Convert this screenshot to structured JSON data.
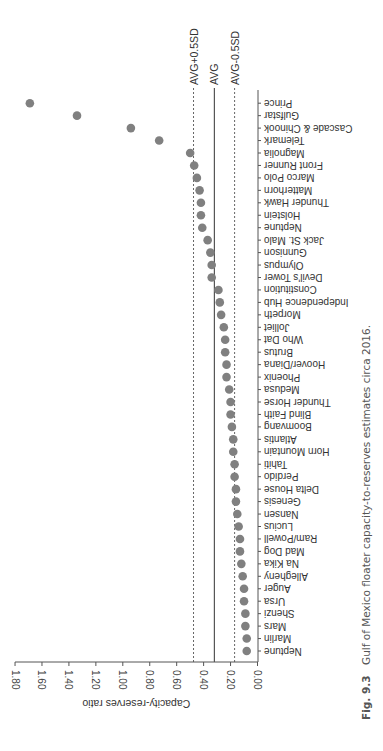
{
  "caption": {
    "label": "Fig. 9.3",
    "text": "Gulf of Mexico floater capacity-to-reserves estimates circa 2016."
  },
  "chart_data": {
    "type": "scatter",
    "orientation": "rotated-90",
    "title": "",
    "xlabel": "",
    "ylabel": "Capacity-reserves ratio",
    "ylim": [
      0,
      1.8
    ],
    "yticks": [
      "0.00",
      "0.20",
      "0.40",
      "0.60",
      "0.80",
      "1.00",
      "1.20",
      "1.40",
      "1.60",
      "1.80"
    ],
    "grid": false,
    "legend": null,
    "marker_color": "#808080",
    "categories": [
      "Neptune",
      "Marlin",
      "Mars",
      "Shenzi",
      "Ursa",
      "Auger",
      "Allegheny",
      "Na Kika",
      "Mad Dog",
      "Ram/Powell",
      "Lucius",
      "Nansen",
      "Genesis",
      "Delta House",
      "Perdido",
      "Tahiti",
      "Horn Mountain",
      "Atlantis",
      "Boomvang",
      "Blind Faith",
      "Thunder Horse",
      "Medusa",
      "Phoenix",
      "Hoover/Diana",
      "Brutus",
      "Who Dat",
      "Jolliet",
      "Morpeth",
      "Independence Hub",
      "Constitution",
      "Devil's Tower",
      "Olympus",
      "Gunnison",
      "Jack St. Malo",
      "Neptune",
      "Holstein",
      "Thunder Hawk",
      "Matterhorn",
      "Marco Polo",
      "Front Runner",
      "Magnolia",
      "Telemark",
      "Cascade & Chinook",
      "Gulfstar",
      "Prince"
    ],
    "values": [
      0.08,
      0.08,
      0.09,
      0.09,
      0.1,
      0.1,
      0.11,
      0.12,
      0.13,
      0.13,
      0.14,
      0.15,
      0.16,
      0.16,
      0.17,
      0.17,
      0.18,
      0.18,
      0.19,
      0.2,
      0.2,
      0.21,
      0.23,
      0.23,
      0.24,
      0.24,
      0.25,
      0.27,
      0.28,
      0.29,
      0.34,
      0.34,
      0.35,
      0.37,
      0.41,
      0.42,
      0.42,
      0.43,
      0.45,
      0.47,
      0.5,
      0.73,
      0.94,
      1.34,
      1.69
    ],
    "reference_lines": [
      {
        "label": "AVG+0.5SD",
        "value": 0.475,
        "style": "dashed"
      },
      {
        "label": "AVG",
        "value": 0.32,
        "style": "solid"
      },
      {
        "label": "AVG-0.5SD",
        "value": 0.17,
        "style": "dashed"
      }
    ]
  }
}
